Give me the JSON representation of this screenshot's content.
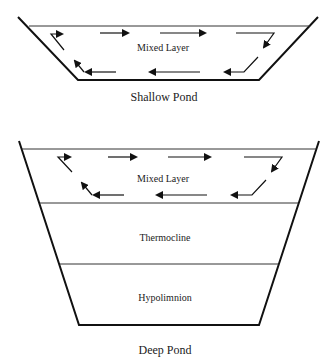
{
  "shallow_pond": {
    "layer_label": "Mixed Layer",
    "caption": "Shallow Pond"
  },
  "deep_pond": {
    "layers": [
      {
        "label": "Mixed Layer"
      },
      {
        "label": "Thermocline"
      },
      {
        "label": "Hypolimnion"
      }
    ],
    "caption": "Deep Pond"
  },
  "colors": {
    "line": "#111111",
    "text": "#222222",
    "background": "#ffffff"
  }
}
